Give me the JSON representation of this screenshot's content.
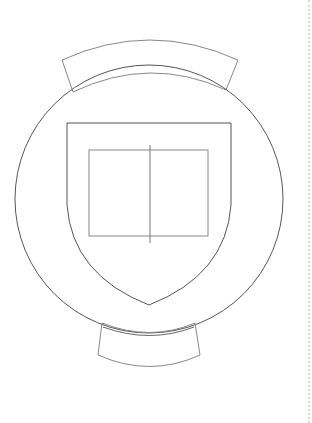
{
  "figure": {
    "type": "line-drawing",
    "stroke_colors": {
      "circle": "#555555",
      "shield": "#555555",
      "bands": "#888888",
      "inner_rect": "#888888",
      "divider": "#777777",
      "page_edge": "#d8d8d8"
    },
    "circle": {
      "cx": 149,
      "cy": 199,
      "r": 134
    },
    "shield": {
      "left": 67,
      "right": 231,
      "top": 123,
      "tip_y": 305
    },
    "inner_rect": {
      "x": 89,
      "y": 150,
      "width": 119,
      "height": 86
    },
    "divider": {
      "x": 150,
      "y1": 145,
      "y2": 243
    },
    "top_band": {
      "left": 62,
      "right": 238,
      "top": 60,
      "peak": 39,
      "inner_peak": 72,
      "bottom_y": 90
    },
    "bottom_band": {
      "left": 98,
      "right": 200,
      "top": 323,
      "bottom": 355,
      "low": 366
    }
  }
}
